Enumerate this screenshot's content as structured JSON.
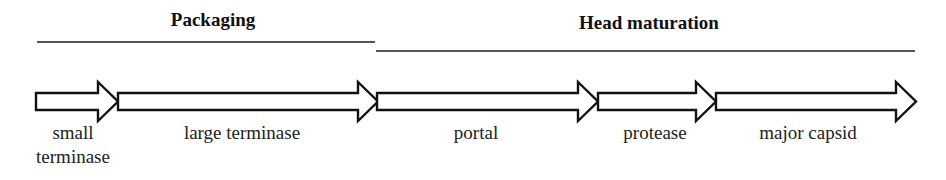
{
  "modules": [
    {
      "title": "Packaging",
      "title_x": 213,
      "title_y": 9,
      "line_x1": 37,
      "line_x2": 375,
      "line_y": 41
    },
    {
      "title": "Head maturation",
      "title_x": 649,
      "title_y": 12,
      "line_x1": 376,
      "line_x2": 915,
      "line_y": 50
    }
  ],
  "genes": [
    {
      "label": "small terminase",
      "label_lines": [
        "small",
        "terminase"
      ],
      "x_start": 36,
      "x_end": 118,
      "label_x": 73
    },
    {
      "label": "large terminase",
      "label_lines": [
        "large terminase"
      ],
      "x_start": 118,
      "x_end": 378,
      "label_x": 242
    },
    {
      "label": "portal",
      "label_lines": [
        "portal"
      ],
      "x_start": 377,
      "x_end": 598,
      "label_x": 476
    },
    {
      "label": "protease",
      "label_lines": [
        "protease"
      ],
      "x_start": 598,
      "x_end": 716,
      "label_x": 655
    },
    {
      "label": "major capsid",
      "label_lines": [
        "major capsid"
      ],
      "x_start": 716,
      "x_end": 916,
      "label_x": 808
    }
  ],
  "style": {
    "stroke": "#111111",
    "fill": "#ffffff"
  }
}
